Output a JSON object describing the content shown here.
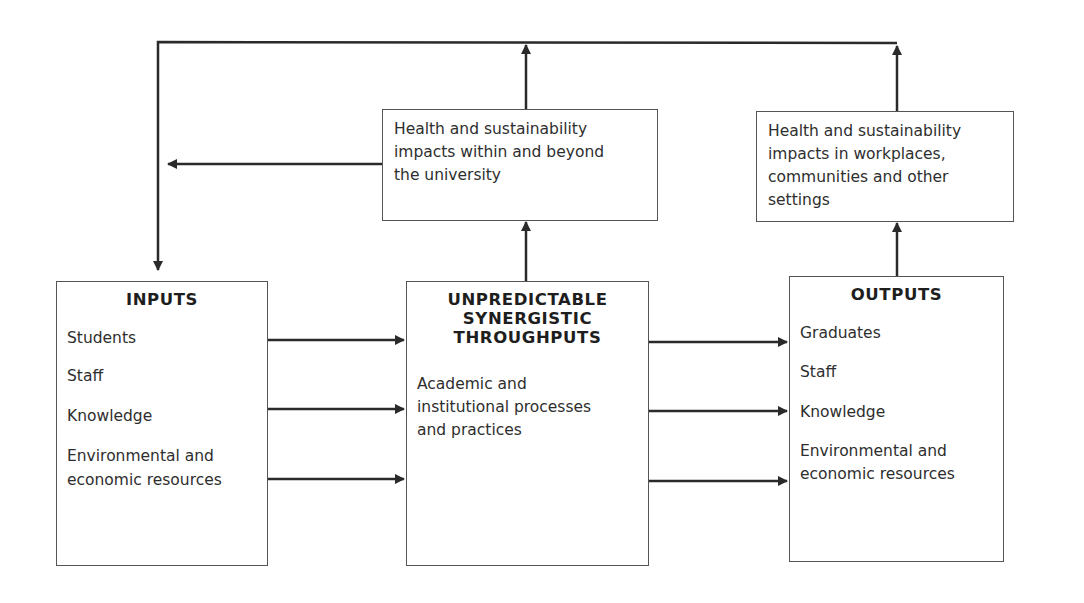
{
  "diagram": {
    "impacts": {
      "university": {
        "lines": [
          "Health and sustainability",
          "impacts within and beyond",
          "the university"
        ]
      },
      "settings": {
        "lines": [
          "Health and sustainability",
          "impacts in workplaces,",
          "communities and other",
          "settings"
        ]
      }
    },
    "inputs": {
      "title": "INPUTS",
      "items": [
        "Students",
        "Staff",
        "Knowledge",
        "Environmental and",
        "economic resources"
      ]
    },
    "throughputs": {
      "title_lines": [
        "UNPREDICTABLE",
        "SYNERGISTIC",
        "THROUGHPUTS"
      ],
      "lines": [
        "Academic and",
        "institutional processes",
        "and practices"
      ]
    },
    "outputs": {
      "title": "OUTPUTS",
      "items": [
        "Graduates",
        "Staff",
        "Knowledge",
        "Environmental and",
        "economic resources"
      ]
    },
    "colors": {
      "line": "#2a2a2a",
      "box_border": "#555555",
      "background": "#ffffff"
    }
  }
}
